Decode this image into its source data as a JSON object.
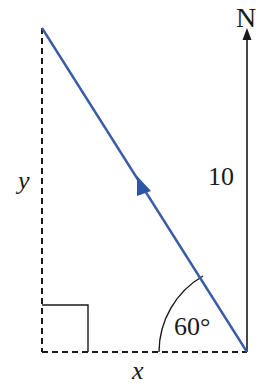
{
  "diagram": {
    "north_label": "N",
    "vertical_length_label": "10",
    "angle_label": "60°",
    "x_label": "x",
    "y_label": "y",
    "colors": {
      "vector": "#3a5ba8",
      "lines": "#1a1a1a"
    }
  }
}
